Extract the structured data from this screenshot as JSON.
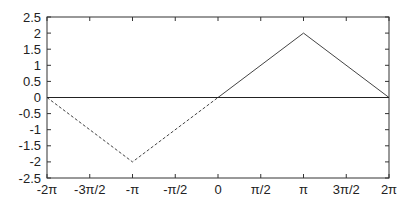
{
  "chart_data": {
    "type": "line",
    "title": "",
    "xlabel": "",
    "ylabel": "",
    "xlim": [
      -6.283185,
      6.283185
    ],
    "ylim": [
      -2.5,
      2.5
    ],
    "grid": false,
    "legend": null,
    "x_ticks": [
      "-2π",
      "-3π/2",
      "-π",
      "-π/2",
      "0",
      "π/2",
      "π",
      "3π/2",
      "2π"
    ],
    "y_ticks": [
      "2.5",
      "2",
      "1.5",
      "1",
      "0.5",
      "0",
      "-0.5",
      "-1",
      "-1.5",
      "-2",
      "-2.5"
    ],
    "series": [
      {
        "name": "dashed-segment",
        "style": "dashed",
        "x": [
          -6.283185,
          -3.141593,
          0
        ],
        "y": [
          0,
          -2,
          0
        ]
      },
      {
        "name": "solid-segment",
        "style": "solid",
        "x": [
          0,
          3.141593,
          6.283185
        ],
        "y": [
          0,
          2,
          0
        ]
      },
      {
        "name": "zero-line",
        "style": "solid",
        "x": [
          -6.283185,
          6.283185
        ],
        "y": [
          0,
          0
        ]
      }
    ]
  },
  "colors": {
    "axis": "#333333",
    "line": "#444444",
    "background": "#ffffff"
  }
}
